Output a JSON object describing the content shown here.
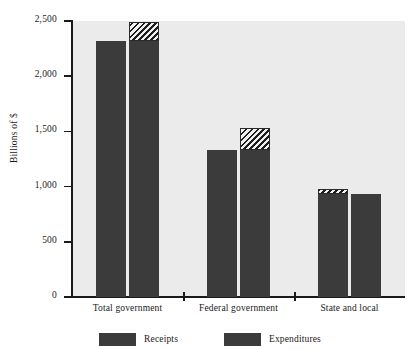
{
  "chart_data": {
    "type": "bar",
    "title": "",
    "xlabel": "",
    "ylabel": "Billions of $",
    "ylim": [
      0,
      2500
    ],
    "yticks": [
      0,
      500,
      1000,
      1500,
      2000,
      2500
    ],
    "ytick_labels": [
      "0",
      "500",
      "1,000",
      "1,500",
      "2,000",
      "2,500"
    ],
    "grid": false,
    "legend_position": "bottom",
    "categories": [
      "Total government",
      "Federal government",
      "State and local"
    ],
    "series": [
      {
        "name": "Receipts",
        "values": [
          2320,
          1330,
          980
        ]
      },
      {
        "name": "Expenditures",
        "values": [
          2490,
          1535,
          935
        ]
      }
    ],
    "bar_color": "#3b3b3b",
    "plot_background": "#ebebeb",
    "axis_color": "#1a1a1a"
  },
  "legend": {
    "items": [
      {
        "label": "Receipts"
      },
      {
        "label": "Expenditures"
      }
    ]
  }
}
